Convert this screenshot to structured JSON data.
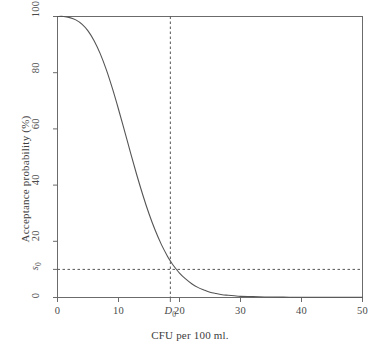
{
  "chart_data": {
    "type": "line",
    "title": "",
    "xlabel": "CFU per 100 ml.",
    "ylabel": "Acceptance probability (%)",
    "xlim": [
      0,
      50
    ],
    "ylim": [
      0,
      100
    ],
    "grid": false,
    "legend": null,
    "x_ticks": [
      {
        "value": 0,
        "label": "0"
      },
      {
        "value": 10,
        "label": "10"
      },
      {
        "value": 18.5,
        "label": "D0",
        "display": "D",
        "subscript": "0",
        "italic": true
      },
      {
        "value": 20,
        "label": "20"
      },
      {
        "value": 30,
        "label": "30"
      },
      {
        "value": 40,
        "label": "40"
      },
      {
        "value": 50,
        "label": "50"
      }
    ],
    "y_ticks": [
      {
        "value": 0,
        "label": "0"
      },
      {
        "value": 10,
        "label": "s0",
        "display": "s",
        "subscript": "0",
        "italic": true
      },
      {
        "value": 20,
        "label": "20"
      },
      {
        "value": 40,
        "label": "40"
      },
      {
        "value": 60,
        "label": "60"
      },
      {
        "value": 80,
        "label": "80"
      },
      {
        "value": 100,
        "label": "100"
      }
    ],
    "series": [
      {
        "name": "Acceptance probability",
        "style": "solid",
        "color": "#555555",
        "x": [
          0,
          1,
          2,
          3,
          4,
          5,
          6,
          7,
          8,
          9,
          10,
          11,
          12,
          13,
          14,
          15,
          16,
          17,
          18,
          18.5,
          19,
          20,
          21,
          22,
          23,
          24,
          25,
          26,
          27,
          28,
          29,
          30,
          32,
          34,
          36,
          38,
          40,
          42,
          44,
          46,
          48,
          50
        ],
        "y": [
          100,
          100,
          99.6,
          98.8,
          97.3,
          94.9,
          91.4,
          86.8,
          81.1,
          74.4,
          67.0,
          59.2,
          51.3,
          43.6,
          36.4,
          29.8,
          24.0,
          19.0,
          14.8,
          13.0,
          11.4,
          8.7,
          6.6,
          4.9,
          3.6,
          2.7,
          1.9,
          1.4,
          1.0,
          0.8,
          0.6,
          0.4,
          0.3,
          0.2,
          0.15,
          0.1,
          0.1,
          0.1,
          0.1,
          0.1,
          0.1,
          0.1
        ]
      }
    ],
    "reference_lines": [
      {
        "name": "vertical-D0",
        "orientation": "vertical",
        "value": 18.5,
        "style": "dashed",
        "color": "#555555"
      },
      {
        "name": "horizontal-s0",
        "orientation": "horizontal",
        "value": 10,
        "style": "dashed",
        "color": "#555555"
      }
    ],
    "annotations": [
      {
        "name": "intersection",
        "x": 18.5,
        "y": 10
      }
    ]
  }
}
